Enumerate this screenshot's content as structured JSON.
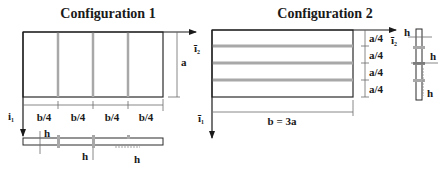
{
  "config1": {
    "title": "Configuration 1",
    "axis_x2_label": "ī",
    "axis_x2_sub": "2",
    "axis_x1_label": "i",
    "axis_x1_sub": "1",
    "height_label": "a",
    "width_labels": [
      "b/4",
      "b/4",
      "b/4",
      "b/4"
    ],
    "section_labels": [
      "h",
      "h",
      "h"
    ],
    "stiffener_count": 3
  },
  "config2": {
    "title": "Configuration 2",
    "axis_x2_label": "ī",
    "axis_x2_sub": "2",
    "axis_x1_label": "ī",
    "axis_x1_sub": "1",
    "height_labels": [
      "a/4",
      "a/4",
      "a/4",
      "a/4"
    ],
    "width_label": "b = 3a",
    "section_labels": [
      "h",
      "h",
      "h"
    ],
    "stiffener_count": 3
  },
  "colors": {
    "line": "#2a2a2a",
    "stiffener": "#a8a8a8",
    "dim_line": "#6a6a6a"
  }
}
